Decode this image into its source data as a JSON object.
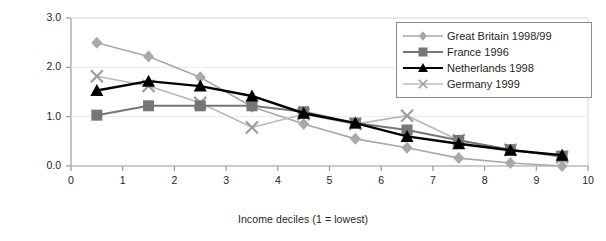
{
  "chart_data": {
    "type": "line",
    "title": "",
    "xlabel": "Income deciles (1 = lowest)",
    "ylabel": "1 = even distribution",
    "xlim": [
      0,
      10
    ],
    "ylim": [
      0.0,
      3.0
    ],
    "xticks": [
      "0",
      "1",
      "2",
      "3",
      "4",
      "5",
      "6",
      "7",
      "8",
      "9",
      "10"
    ],
    "yticks": [
      "0.0",
      "1.0",
      "2.0",
      "3.0"
    ],
    "grid": false,
    "legend_position": "top-right",
    "x": [
      0.5,
      1.5,
      2.5,
      3.5,
      4.5,
      5.5,
      6.5,
      7.5,
      8.5,
      9.5
    ],
    "series": [
      {
        "name": "Great Britain 1998/99",
        "color": "#a8a8a8",
        "marker": "diamond",
        "values": [
          2.5,
          2.22,
          1.8,
          1.2,
          0.85,
          0.55,
          0.37,
          0.16,
          0.06,
          0.0
        ]
      },
      {
        "name": "France 1996",
        "color": "#767676",
        "marker": "square",
        "values": [
          1.03,
          1.22,
          1.22,
          1.22,
          1.1,
          0.87,
          0.73,
          0.52,
          0.33,
          0.2
        ]
      },
      {
        "name": "Netherlands 1998",
        "color": "#000000",
        "marker": "triangle",
        "values": [
          1.53,
          1.72,
          1.62,
          1.42,
          1.07,
          0.87,
          0.6,
          0.45,
          0.32,
          0.22
        ]
      },
      {
        "name": "Germany 1999",
        "color": "#b8b8b8",
        "marker": "cross",
        "values": [
          1.82,
          1.62,
          1.28,
          0.78,
          1.05,
          0.85,
          1.02,
          0.52,
          0.33,
          0.18
        ]
      }
    ]
  },
  "legend": {
    "items": [
      {
        "label": "Great Britain 1998/99"
      },
      {
        "label": "France 1996"
      },
      {
        "label": "Netherlands 1998"
      },
      {
        "label": "Germany 1999"
      }
    ]
  }
}
